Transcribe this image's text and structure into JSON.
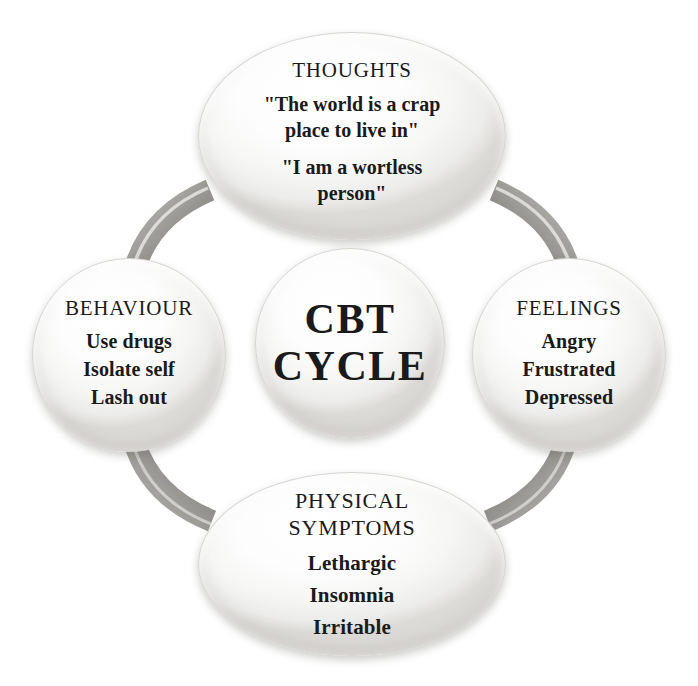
{
  "diagram": {
    "title": "CBT Cycle",
    "type": "cycle-diagram",
    "background_color": "#ffffff",
    "bubble_color": "#f6f6f5",
    "connector_color": "#9a9a9a",
    "text_color": "#1a1a1a"
  },
  "center": {
    "line1": "CBT",
    "line2": "CYCLE"
  },
  "nodes": {
    "thoughts": {
      "title": "THOUGHTS",
      "quotes": [
        {
          "line1": "\"The world is a crap",
          "line2": "place to live in\""
        },
        {
          "line1": "\"I am a wortless",
          "line2": "person\""
        }
      ]
    },
    "behaviour": {
      "title": "BEHAVIOUR",
      "items": [
        "Use drugs",
        "Isolate self",
        "Lash out"
      ]
    },
    "feelings": {
      "title": "FEELINGS",
      "items": [
        "Angry",
        "Frustrated",
        "Depressed"
      ]
    },
    "physical": {
      "title_line1": "PHYSICAL",
      "title_line2": "SYMPTOMS",
      "items": [
        "Lethargic",
        "Insomnia",
        "Irritable"
      ]
    }
  },
  "connectors": [
    {
      "name": "behaviour-to-thoughts",
      "from": "behaviour",
      "to": "thoughts"
    },
    {
      "name": "thoughts-to-feelings",
      "from": "thoughts",
      "to": "feelings"
    },
    {
      "name": "feelings-to-physical",
      "from": "feelings",
      "to": "physical"
    },
    {
      "name": "physical-to-behaviour",
      "from": "physical",
      "to": "behaviour"
    }
  ]
}
